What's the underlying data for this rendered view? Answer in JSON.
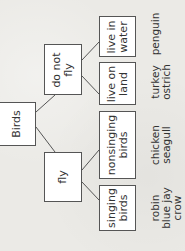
{
  "diagram": {
    "type": "tree",
    "orientation": "rotated-90-ccw",
    "root": {
      "label": "Birds"
    },
    "level1": [
      {
        "id": "do_not_fly",
        "label": "do not\nfly"
      },
      {
        "id": "fly",
        "label": "fly"
      }
    ],
    "level2": [
      {
        "id": "live_in_water",
        "parent": "do_not_fly",
        "label": "live in\nwater",
        "examples": "penguin"
      },
      {
        "id": "live_on_land",
        "parent": "do_not_fly",
        "label": "live on\nland",
        "examples": "turkey\nostrich"
      },
      {
        "id": "nonsinging_birds",
        "parent": "fly",
        "label": "nonsinging\nbirds",
        "examples": "chicken\nseagull"
      },
      {
        "id": "singing_birds",
        "parent": "fly",
        "label": "singing\nbirds",
        "examples": "robin\nblue jay\ncrow"
      }
    ]
  }
}
